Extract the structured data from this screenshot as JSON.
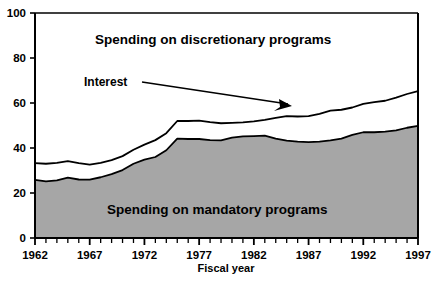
{
  "chart_data": {
    "type": "area",
    "title": "",
    "xlabel": "Fiscal year",
    "ylabel": "",
    "stacked": true,
    "grid": false,
    "legend_position": "inline-annotations",
    "xlim": [
      1962,
      1997
    ],
    "ylim": [
      0,
      100
    ],
    "ytick_labels": [
      "0",
      "20",
      "40",
      "60",
      "80",
      "100"
    ],
    "yticks": [
      0,
      20,
      40,
      60,
      80,
      100
    ],
    "xtick_labels": [
      "1962",
      "1967",
      "1972",
      "1977",
      "1982",
      "1987",
      "1992",
      "1997"
    ],
    "xticks": [
      1962,
      1967,
      1972,
      1977,
      1982,
      1987,
      1992,
      1997
    ],
    "xtick_minor_every": 1,
    "x": [
      1962,
      1963,
      1964,
      1965,
      1966,
      1967,
      1968,
      1969,
      1970,
      1971,
      1972,
      1973,
      1974,
      1975,
      1976,
      1977,
      1978,
      1979,
      1980,
      1981,
      1982,
      1983,
      1984,
      1985,
      1986,
      1987,
      1988,
      1989,
      1990,
      1991,
      1992,
      1993,
      1994,
      1995,
      1996,
      1997
    ],
    "series": [
      {
        "name": "Spending on mandatory programs",
        "fill": "#a6a6a6",
        "stroke": "#000000",
        "cumulative_values": [
          25.8,
          25.2,
          25.6,
          26.8,
          26.0,
          25.9,
          27.0,
          28.4,
          30.2,
          33.0,
          34.8,
          36.0,
          39.0,
          44.2,
          44.0,
          44.0,
          43.5,
          43.4,
          44.6,
          45.2,
          45.3,
          45.5,
          44.2,
          43.3,
          42.8,
          42.6,
          42.8,
          43.4,
          44.2,
          45.8,
          47.0,
          47.0,
          47.3,
          47.8,
          49.0,
          49.8
        ]
      },
      {
        "name": "Interest",
        "fill": "#ffffff",
        "stroke": "#000000",
        "cumulative_values": [
          33.3,
          33.0,
          33.4,
          34.2,
          33.3,
          32.6,
          33.4,
          34.6,
          36.4,
          39.2,
          41.5,
          43.5,
          46.6,
          52.0,
          52.0,
          52.2,
          51.5,
          51.0,
          51.2,
          51.4,
          51.8,
          52.5,
          53.4,
          54.2,
          54.0,
          54.2,
          55.2,
          56.6,
          57.0,
          58.0,
          59.6,
          60.4,
          61.0,
          62.4,
          64.0,
          65.3
        ]
      }
    ],
    "annotations": [
      {
        "name": "discretionary-label",
        "text": "Spending on discretionary programs",
        "x_px": 95,
        "y_px": 44
      },
      {
        "name": "mandatory-label",
        "text": "Spending on mandatory programs",
        "x_px": 107,
        "y_px": 214
      },
      {
        "name": "interest-callout",
        "text": "Interest",
        "x_px": 84,
        "y_px": 86,
        "leader_from": [
          142,
          82
        ],
        "leader_to": [
          292,
          106
        ]
      }
    ],
    "colors": {
      "mandatory_fill": "#a6a6a6",
      "interest_fill": "#ffffff",
      "discretionary_fill": "#ffffff",
      "axis": "#000000",
      "text": "#000000",
      "background": "#ffffff"
    }
  },
  "axis": {
    "x_title": "Fiscal year",
    "y_ticks": [
      "100",
      "80",
      "60",
      "40",
      "20",
      "0"
    ],
    "x_ticks": [
      "1962",
      "1967",
      "1972",
      "1977",
      "1982",
      "1987",
      "1992",
      "1997"
    ]
  },
  "labels": {
    "discretionary": "Spending on discretionary programs",
    "mandatory": "Spending on mandatory programs",
    "interest": "Interest"
  }
}
